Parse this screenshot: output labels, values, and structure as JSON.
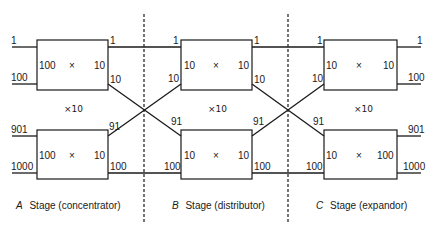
{
  "diagram": {
    "type": "three-stage switching network",
    "stages": [
      {
        "id": "A",
        "caption_letter": "A",
        "caption_text": "Stage (concentrator)",
        "replication": "×10",
        "boxes": [
          {
            "position": "top",
            "inputs_label": "100",
            "cross": "×",
            "outputs_label": "10",
            "left_pins": [
              "1",
              "100"
            ],
            "right_pins": [
              "1",
              "10"
            ]
          },
          {
            "position": "bottom",
            "inputs_label": "100",
            "cross": "×",
            "outputs_label": "10",
            "left_pins": [
              "901",
              "1000"
            ],
            "right_pins": [
              "91",
              "100"
            ]
          }
        ]
      },
      {
        "id": "B",
        "caption_letter": "B",
        "caption_text": "Stage (distributor)",
        "replication": "×10",
        "boxes": [
          {
            "position": "top",
            "inputs_label": "10",
            "cross": "×",
            "outputs_label": "10",
            "left_pins": [
              "1",
              "10"
            ],
            "right_pins": [
              "1",
              "10"
            ]
          },
          {
            "position": "bottom",
            "inputs_label": "10",
            "cross": "×",
            "outputs_label": "10",
            "left_pins": [
              "91",
              "100"
            ],
            "right_pins": [
              "91",
              "100"
            ]
          }
        ]
      },
      {
        "id": "C",
        "caption_letter": "C",
        "caption_text": "Stage (expandor)",
        "replication": "×10",
        "boxes": [
          {
            "position": "top",
            "inputs_label": "10",
            "cross": "×",
            "outputs_label": "10",
            "left_pins": [
              "1",
              "10"
            ],
            "right_pins": [
              "1",
              "100"
            ]
          },
          {
            "position": "bottom",
            "inputs_label": "10",
            "cross": "×",
            "outputs_label": "100",
            "left_pins": [
              "91",
              "100"
            ],
            "right_pins": [
              "901",
              "1000"
            ]
          }
        ]
      }
    ],
    "colors": {
      "line": "#1a1a1a",
      "background": "#ffffff"
    }
  }
}
